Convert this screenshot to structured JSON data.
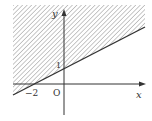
{
  "figure": {
    "type": "inequality-region",
    "line": {
      "equation": "y = x/2 + 1",
      "x_intercept": -2,
      "y_intercept": 1
    },
    "shaded_region": "above line",
    "labels": {
      "y_axis": "y",
      "x_axis": "x",
      "origin": "O",
      "y_tick": "1",
      "x_tick": "−2"
    },
    "colors": {
      "hatch": "#9a9a9a",
      "line": "#333333",
      "axis": "#333333",
      "background": "#ffffff"
    }
  }
}
